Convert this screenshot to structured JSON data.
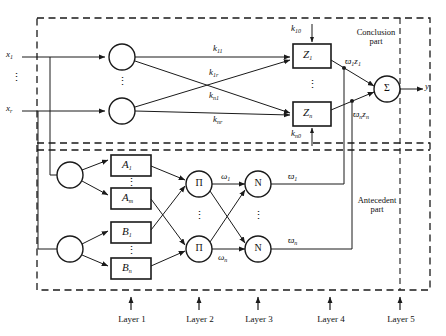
{
  "diagram": {
    "regions": {
      "conclusion": "Conclusion\npart",
      "conclusion_line1": "Conclusion",
      "conclusion_line2": "part",
      "antecedent_line1": "Antecedent",
      "antecedent_line2": "part"
    },
    "inputs": [
      {
        "name": "input-x1",
        "label": "x",
        "subscript": "1"
      },
      {
        "name": "input-xr",
        "label": "x",
        "subscript": "r"
      }
    ],
    "output": {
      "name": "output-y",
      "label": "y"
    },
    "weights_conclusion": [
      {
        "name": "weight-k11",
        "label": "k",
        "subscript": "11"
      },
      {
        "name": "weight-k1r",
        "label": "k",
        "subscript": "1r"
      },
      {
        "name": "weight-kn1",
        "label": "k",
        "subscript": "n1"
      },
      {
        "name": "weight-knr",
        "label": "k",
        "subscript": "nr"
      },
      {
        "name": "bias-k10",
        "label": "k",
        "subscript": "10"
      },
      {
        "name": "bias-kn0",
        "label": "k",
        "subscript": "n0"
      }
    ],
    "z_nodes": [
      {
        "name": "z-node-1",
        "label": "Z",
        "subscript": "1"
      },
      {
        "name": "z-node-n",
        "label": "Z",
        "subscript": "n"
      }
    ],
    "sum_node": {
      "name": "sum-node",
      "label": "Σ"
    },
    "products": [
      {
        "name": "product-node-1",
        "label": "Π"
      },
      {
        "name": "product-node-n",
        "label": "Π"
      }
    ],
    "normalizers": [
      {
        "name": "normalize-node-1",
        "label": "N"
      },
      {
        "name": "normalize-node-n",
        "label": "N"
      }
    ],
    "membership_a": [
      {
        "name": "membership-A1",
        "label": "A",
        "subscript": "1"
      },
      {
        "name": "membership-Am",
        "label": "A",
        "subscript": "m"
      }
    ],
    "membership_b": [
      {
        "name": "membership-B1",
        "label": "B",
        "subscript": "1"
      },
      {
        "name": "membership-Bn",
        "label": "B",
        "subscript": "n"
      }
    ],
    "firing_strengths": [
      {
        "name": "omega-1",
        "label": "ω",
        "subscript": "1"
      },
      {
        "name": "omega-n",
        "label": "ω",
        "subscript": "n"
      }
    ],
    "normalized_strengths": [
      {
        "name": "omega-bar-1",
        "label": "ϖ",
        "subscript": "1"
      },
      {
        "name": "omega-bar-n",
        "label": "ϖ",
        "subscript": "n"
      }
    ],
    "weighted_outputs": [
      {
        "name": "weighted-output-1",
        "label": "ϖ",
        "subscript": "1",
        "term": "z",
        "term_subscript": "1"
      },
      {
        "name": "weighted-output-n",
        "label": "ϖ",
        "subscript": "n",
        "term": "z",
        "term_subscript": "n"
      }
    ],
    "layers": [
      {
        "name": "layer-label-1",
        "label": "Layer 1"
      },
      {
        "name": "layer-label-2",
        "label": "Layer 2"
      },
      {
        "name": "layer-label-3",
        "label": "Layer 3"
      },
      {
        "name": "layer-label-4",
        "label": "Layer 4"
      },
      {
        "name": "layer-label-5",
        "label": "Layer 5"
      }
    ],
    "vertical_ellipsis": "⋮",
    "colors": {
      "stroke": "#1a1a1a",
      "background": "#ffffff",
      "text": "#111111"
    }
  }
}
